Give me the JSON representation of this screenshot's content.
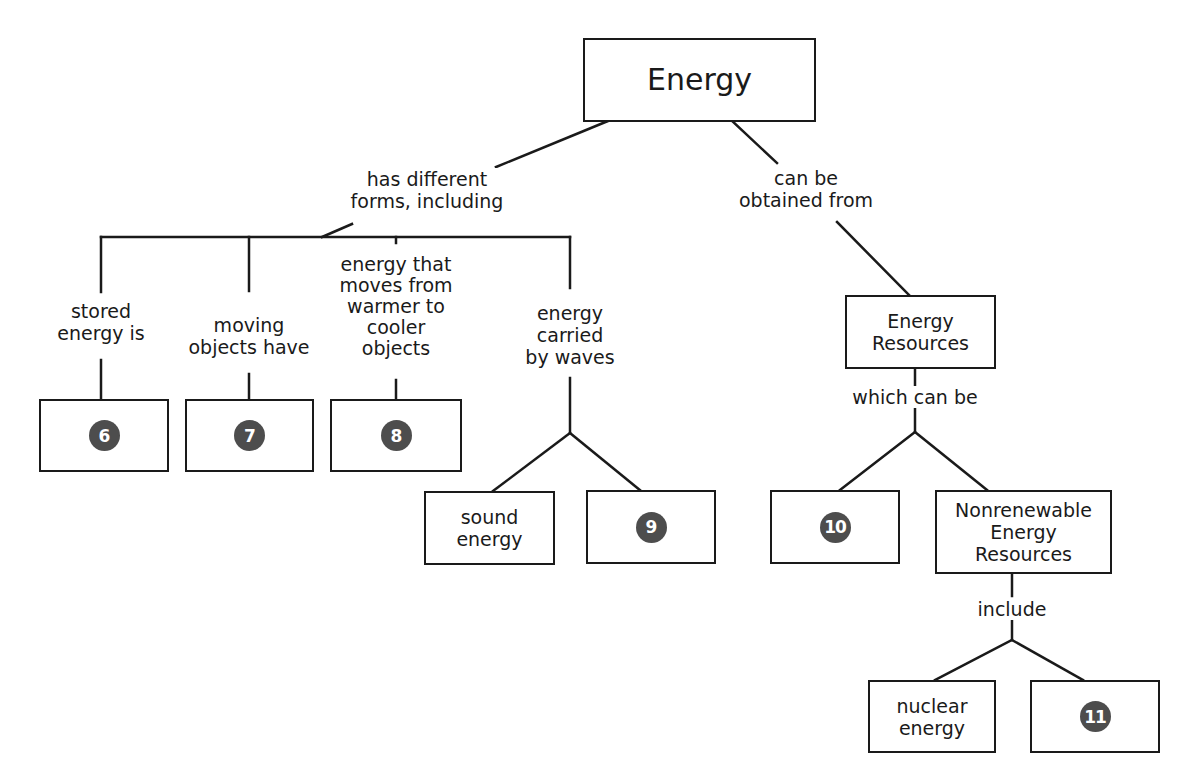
{
  "root": {
    "label": "Energy"
  },
  "links": {
    "forms": "has different\nforms, including",
    "obtained": "can be\nobtained from",
    "which": "which can be",
    "include": "include"
  },
  "forms": [
    {
      "label": "stored\nenergy is",
      "answer_number": "6"
    },
    {
      "label": "moving\nobjects have",
      "answer_number": "7"
    },
    {
      "label": "energy that\nmoves from\nwarmer to\ncooler\nobjects",
      "answer_number": "8"
    },
    {
      "label": "energy\ncarried\nby waves"
    }
  ],
  "waves": {
    "known": "sound\nenergy",
    "answer_number": "9"
  },
  "resources": {
    "label": "Energy\nResources",
    "renewable_answer_number": "10",
    "nonrenewable": "Nonrenewable\nEnergy\nResources"
  },
  "nonrenewable_types": {
    "known": "nuclear\nenergy",
    "answer_number": "11"
  },
  "colors": {
    "line": "#1a1a1a",
    "answer_circle": "#4d4d4d",
    "background": "#ffffff"
  }
}
